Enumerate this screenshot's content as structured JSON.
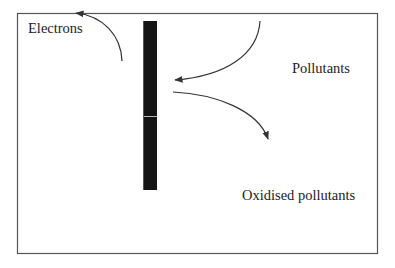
{
  "diagram": {
    "labels": {
      "electrons": "Electrons",
      "pollutants": "Pollutants",
      "oxidised_pollutants": "Oxidised pollutants"
    },
    "colors": {
      "frame": "#555555",
      "electrode": "#141414",
      "electrode_stripe": "#b8b8b8",
      "arrow": "#333333",
      "text": "#222222",
      "background": "#ffffff"
    },
    "arrows": [
      {
        "name": "electrons-arrow",
        "from": "electrode",
        "to": "top-left",
        "direction": "out"
      },
      {
        "name": "pollutants-arrow",
        "from": "pollutants",
        "to": "electrode",
        "direction": "in"
      },
      {
        "name": "oxidised-arrow",
        "from": "electrode",
        "to": "oxidised pollutants",
        "direction": "out"
      }
    ]
  }
}
